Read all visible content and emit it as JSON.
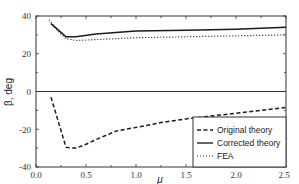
{
  "chart_data": {
    "type": "line",
    "title": "",
    "xlabel": "μ",
    "ylabel": "β, deg",
    "xlim": [
      0.0,
      2.5
    ],
    "ylim": [
      -40,
      40
    ],
    "xticks": [
      "0.0",
      "0.5",
      "1.0",
      "1.5",
      "2.0",
      "2.5"
    ],
    "yticks": [
      "-40",
      "-20",
      "0",
      "20",
      "40"
    ],
    "grid": false,
    "legend_position": "lower right",
    "series": [
      {
        "name": "Original theory",
        "style": "dashed",
        "x": [
          0.15,
          0.3,
          0.35,
          0.4,
          0.5,
          0.6,
          0.8,
          1.0,
          1.25,
          1.5,
          2.0,
          2.5
        ],
        "y": [
          -3,
          -29.5,
          -30,
          -30,
          -28,
          -25.5,
          -21,
          -19,
          -16.5,
          -14.5,
          -11.5,
          -8.5
        ]
      },
      {
        "name": "Corrected theory",
        "style": "solid",
        "x": [
          0.15,
          0.3,
          0.4,
          0.6,
          1.0,
          1.5,
          2.0,
          2.5
        ],
        "y": [
          36,
          29,
          29,
          30.5,
          32,
          32.5,
          33,
          34
        ]
      },
      {
        "name": "FEA",
        "style": "dotted",
        "x": [
          0.13,
          0.2,
          0.3,
          0.4,
          0.6,
          1.0,
          1.5,
          2.0,
          2.5
        ],
        "y": [
          38,
          33,
          28,
          27,
          27.5,
          28.5,
          29,
          29.5,
          30
        ]
      }
    ]
  },
  "legend": {
    "items": [
      {
        "label": "Original theory",
        "style": "dashed"
      },
      {
        "label": "Corrected theory",
        "style": "solid"
      },
      {
        "label": "FEA",
        "style": "dotted"
      }
    ]
  },
  "axes": {
    "xlabel": "μ",
    "ylabel": "β, deg",
    "xticks": [
      "0.0",
      "0.5",
      "1.0",
      "1.5",
      "2.0",
      "2.5"
    ],
    "yticks": [
      "40",
      "20",
      "0",
      "-20",
      "-40"
    ]
  }
}
